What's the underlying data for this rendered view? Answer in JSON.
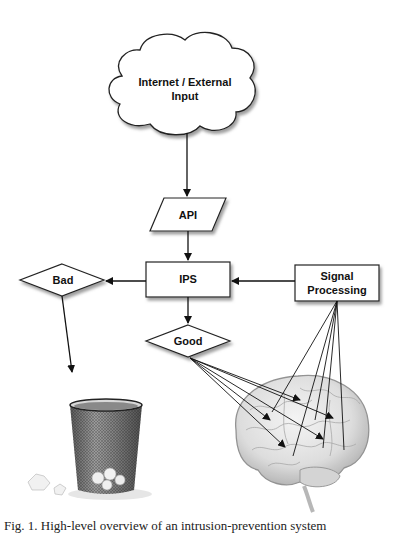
{
  "diagram": {
    "nodes": {
      "internet": {
        "label_line1": "Internet / External",
        "label_line2": "Input",
        "shape": "cloud"
      },
      "api": {
        "label": "API",
        "shape": "parallelogram"
      },
      "ips": {
        "label": "IPS",
        "shape": "rectangle"
      },
      "bad": {
        "label": "Bad",
        "shape": "diamond"
      },
      "good": {
        "label": "Good",
        "shape": "diamond"
      },
      "signal": {
        "label_line1": "Signal",
        "label_line2": "Processing",
        "shape": "rectangle"
      },
      "trash": {
        "label": "trash-can-image"
      },
      "brain": {
        "label": "brain-image"
      }
    },
    "edges": [
      {
        "from": "internet",
        "to": "api"
      },
      {
        "from": "api",
        "to": "ips"
      },
      {
        "from": "signal",
        "to": "ips"
      },
      {
        "from": "ips",
        "to": "bad"
      },
      {
        "from": "ips",
        "to": "good"
      },
      {
        "from": "bad",
        "to": "trash"
      },
      {
        "from": "good",
        "to": "brain",
        "count": 5
      },
      {
        "from": "signal",
        "to": "brain",
        "count": 5
      }
    ],
    "colors": {
      "stroke": "#222222",
      "fill": "#ffffff",
      "shadow": "#9a9a9a"
    }
  },
  "caption": "Fig. 1. High-level overview of an intrusion-prevention system"
}
